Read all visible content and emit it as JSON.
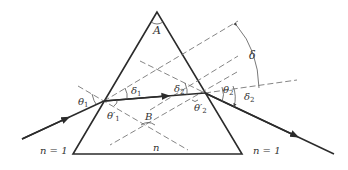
{
  "diagram": {
    "labels": {
      "apex_angle": "A",
      "normal_angle": "B",
      "deviation_total": "δ",
      "deviation_1": "δ",
      "deviation_1_sub": "1",
      "deviation_2": "δ",
      "deviation_2_sub": "2",
      "theta_1": "θ",
      "theta_1_sub": "1",
      "theta_1_prime": "θ′",
      "theta_1_prime_sub": "1",
      "theta_2": "θ",
      "theta_2_sub": "2",
      "theta_2_prime": "θ′",
      "theta_2_prime_sub": "2",
      "prism_index": "n",
      "left_medium_index": "n = 1",
      "right_medium_index": "n = 1"
    },
    "colors": {
      "line": "#2b2b2b",
      "dashed": "#777777",
      "text": "#333333"
    }
  }
}
